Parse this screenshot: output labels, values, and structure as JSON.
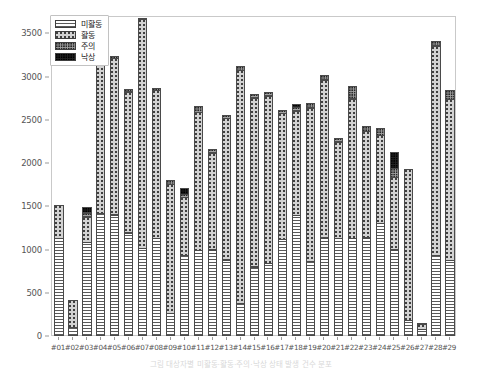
{
  "chart_data": {
    "type": "bar",
    "subtype": "stacked-bar",
    "title": "",
    "xlabel": "",
    "ylabel": "",
    "ylim": [
      0,
      3700
    ],
    "yticks": [
      0,
      500,
      1000,
      1500,
      2000,
      2500,
      3000,
      3500
    ],
    "grid": false,
    "legend_position": "upper left",
    "categories": [
      "#01",
      "#02",
      "#03",
      "#04",
      "#05",
      "#06",
      "#07",
      "#08",
      "#09",
      "#10",
      "#11",
      "#12",
      "#13",
      "#14",
      "#15",
      "#16",
      "#17",
      "#18",
      "#19",
      "#20",
      "#21",
      "#22",
      "#23",
      "#24",
      "#25",
      "#26",
      "#27",
      "#28",
      "#29"
    ],
    "series": [
      {
        "name": "미활동",
        "key": "inactive",
        "pattern": "horizontal-lines",
        "color": "#ffffff",
        "values": [
          1130,
          100,
          1085,
          1415,
          1400,
          1190,
          1010,
          1130,
          260,
          930,
          990,
          995,
          880,
          380,
          800,
          840,
          1120,
          1390,
          865,
          1135,
          1130,
          1130,
          1135,
          1300,
          995,
          180,
          75,
          930,
          870
        ]
      },
      {
        "name": "활동",
        "key": "active",
        "pattern": "sparse-dots",
        "color": "#d2d2d2",
        "values": [
          395,
          325,
          300,
          1790,
          1820,
          1640,
          2655,
          1720,
          1500,
          680,
          1605,
          1130,
          1640,
          2700,
          1960,
          1945,
          1460,
          1220,
          1780,
          1835,
          1120,
          1620,
          1240,
          1030,
          845,
          1760,
          65,
          2430,
          1870
        ]
      },
      {
        "name": "주의",
        "key": "caution",
        "pattern": "dense-dots",
        "color": "#a2a2a2",
        "values": [
          0,
          0,
          55,
          35,
          30,
          40,
          25,
          35,
          60,
          40,
          80,
          45,
          45,
          55,
          45,
          45,
          50,
          50,
          60,
          55,
          55,
          155,
          60,
          90,
          110,
          0,
          25,
          60,
          120
        ]
      },
      {
        "name": "낙상",
        "key": "fall",
        "pattern": "solid-dark",
        "color": "#232323",
        "values": [
          0,
          0,
          75,
          0,
          0,
          0,
          0,
          0,
          0,
          80,
          0,
          0,
          0,
          0,
          0,
          0,
          0,
          45,
          0,
          0,
          0,
          0,
          0,
          0,
          200,
          0,
          0,
          0,
          0
        ]
      }
    ],
    "totals": [
      1525,
      425,
      1515,
      3240,
      3250,
      2870,
      3690,
      2885,
      1820,
      1730,
      2675,
      2170,
      2565,
      3135,
      2805,
      2830,
      2630,
      2705,
      2705,
      3025,
      2305,
      2905,
      2435,
      2420,
      2150,
      1940,
      165,
      3420,
      2860
    ]
  },
  "legend": {
    "items": [
      {
        "label": "미활동"
      },
      {
        "label": "활동"
      },
      {
        "label": "주의"
      },
      {
        "label": "낙상"
      }
    ]
  },
  "caption": {
    "text": "그림  대상자별 미활동·활동·주의·낙상 상태 발생 건수 분포"
  }
}
